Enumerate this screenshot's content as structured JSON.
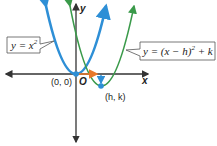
{
  "diagram": {
    "axes": {
      "x_label": "x",
      "y_label": "y",
      "origin_label": "O"
    },
    "curves": [
      {
        "name": "parent",
        "equation_prefix": "y = x",
        "exponent": "2",
        "color": "#2e8fd6"
      },
      {
        "name": "translated",
        "equation_prefix": "y = (x − h)",
        "exponent": "2",
        "equation_suffix": " + k",
        "color": "#3a9a4a"
      }
    ],
    "points": [
      {
        "label": "(0, 0)",
        "color": "#2e8fd6"
      },
      {
        "label": "(h, k)",
        "color": "#2e8fd6"
      }
    ],
    "arrows": [
      {
        "name": "horizontal-shift",
        "color": "#e8782a"
      },
      {
        "name": "vertical-shift",
        "color": "#2e8fd6"
      }
    ]
  }
}
